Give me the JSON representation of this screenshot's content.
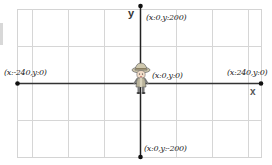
{
  "diagram": {
    "axes": {
      "x_label": "x",
      "y_label": "y"
    },
    "points": [
      {
        "name": "top",
        "label": "(x:0,y:200)",
        "x": 0,
        "y": 200
      },
      {
        "name": "left",
        "label": "(x:-240,y:0)",
        "x": -240,
        "y": 0
      },
      {
        "name": "center",
        "label": "(x:0,y:0)",
        "x": 0,
        "y": 0
      },
      {
        "name": "right",
        "label": "(x:240,y:0)",
        "x": 240,
        "y": 0
      },
      {
        "name": "bottom",
        "label": "(x:0,y:-200)",
        "x": 0,
        "y": -200
      }
    ],
    "sprite": "explorer-character",
    "colors": {
      "grid": "#d4d4d4",
      "axis": "#222222",
      "dot": "#111111",
      "background": "#ffffff"
    }
  }
}
